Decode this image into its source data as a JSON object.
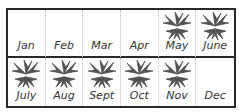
{
  "calendar": {
    "months": [
      {
        "label": "Jan",
        "active": false
      },
      {
        "label": "Feb",
        "active": false
      },
      {
        "label": "Mar",
        "active": false
      },
      {
        "label": "Apr",
        "active": false
      },
      {
        "label": "May",
        "active": true
      },
      {
        "label": "June",
        "active": true
      },
      {
        "label": "July",
        "active": true
      },
      {
        "label": "Aug",
        "active": true
      },
      {
        "label": "Sept",
        "active": true
      },
      {
        "label": "Oct",
        "active": true
      },
      {
        "label": "Nov",
        "active": true
      },
      {
        "label": "Dec",
        "active": false
      }
    ],
    "icon": "plant-icon",
    "colors": {
      "border": "#2a2a2a",
      "divider": "#bdbdbd",
      "plant": "#4a4a4a",
      "text": "#333333"
    }
  }
}
